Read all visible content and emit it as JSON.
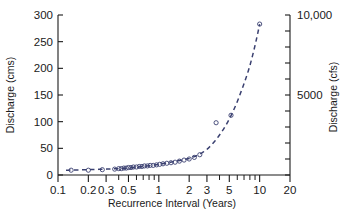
{
  "chart_data": {
    "type": "scatter",
    "title": "",
    "xlabel": "Recurrence Interval (Years)",
    "ylabel": "Discharge (cms)",
    "y2label": "Discharge (cfs)",
    "xscale": "log",
    "yscale": "linear",
    "xlim": [
      0.1,
      20
    ],
    "ylim": [
      0,
      300
    ],
    "y2lim": [
      0,
      10594
    ],
    "grid": false,
    "legend": null,
    "xticks": [
      0.1,
      0.2,
      0.3,
      0.5,
      1,
      2,
      3,
      5,
      10,
      20
    ],
    "xticklabels": [
      "0.1",
      "0.2",
      "0.3",
      "0.5",
      "1",
      "2",
      "3",
      "5",
      "10",
      "20"
    ],
    "yticks": [
      0,
      50,
      100,
      150,
      200,
      250,
      300
    ],
    "yticklabels": [
      "0",
      "50",
      "100",
      "150",
      "200",
      "250",
      "300"
    ],
    "y2ticks": [
      5000,
      10000
    ],
    "y2ticklabels": [
      "5000",
      "10,000"
    ],
    "y2_minor_tick_count": 11,
    "series": [
      {
        "name": "observations",
        "marker": "open-circle",
        "color": "#3a4070",
        "x": [
          0.135,
          0.2,
          0.275,
          0.365,
          0.4,
          0.425,
          0.45,
          0.475,
          0.5,
          0.53,
          0.56,
          0.6,
          0.64,
          0.68,
          0.72,
          0.77,
          0.82,
          0.88,
          0.95,
          1.02,
          1.1,
          1.2,
          1.32,
          1.45,
          1.6,
          1.78,
          2.0,
          2.25,
          2.55,
          3.7,
          5.2,
          10.0
        ],
        "y": [
          9,
          9,
          10,
          11,
          12,
          12,
          13,
          13,
          14,
          14,
          15,
          15,
          16,
          16,
          17,
          17,
          18,
          18,
          19,
          20,
          21,
          22,
          23,
          24,
          26,
          28,
          30,
          33,
          38,
          98,
          112,
          283
        ]
      },
      {
        "name": "fitted-curve",
        "style": "dashed",
        "color": "#3a4070",
        "x": [
          0.12,
          0.2,
          0.3,
          0.4,
          0.5,
          0.7,
          1.0,
          1.4,
          2.0,
          2.5,
          3.0,
          4.0,
          5.0,
          6.5,
          8.0,
          10.0
        ],
        "y": [
          9,
          10,
          11,
          12,
          13,
          16,
          20,
          25,
          31,
          38,
          48,
          75,
          105,
          155,
          205,
          283
        ]
      }
    ]
  }
}
